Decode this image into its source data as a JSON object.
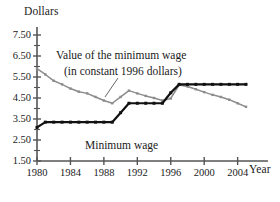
{
  "figure": {
    "background": "#ffffff",
    "axis_color": "#555555"
  },
  "labels": {
    "y_axis_title": "Dollars",
    "x_axis_title": "Year"
  },
  "annotations": {
    "real_line1": "Value of the minimum wage",
    "real_line2": "(in constant 1996 dollars)",
    "nominal": "Minimum wage"
  },
  "chart_data": {
    "type": "line",
    "title": "",
    "xlabel": "Year",
    "ylabel": "Dollars",
    "xlim": [
      1980,
      2005
    ],
    "ylim": [
      1.5,
      7.5
    ],
    "grid": false,
    "legend_position": "inline-annotations",
    "y_ticks": [
      "1.50",
      "2.50",
      "3.50",
      "4.50",
      "5.50",
      "6.50",
      "7.50"
    ],
    "y_tick_values": [
      1.5,
      2.5,
      3.5,
      4.5,
      5.5,
      6.5,
      7.5
    ],
    "y_minor_tick_values": [
      2.0,
      3.0,
      4.0,
      5.0,
      6.0,
      7.0
    ],
    "x_ticks": [
      "1980",
      "1984",
      "1988",
      "1992",
      "1996",
      "2000",
      "2004"
    ],
    "x_tick_values": [
      1980,
      1984,
      1988,
      1992,
      1996,
      2000,
      2004
    ],
    "x": [
      1980,
      1981,
      1982,
      1983,
      1984,
      1985,
      1986,
      1987,
      1988,
      1989,
      1990,
      1991,
      1992,
      1993,
      1994,
      1995,
      1996,
      1997,
      1998,
      1999,
      2000,
      2001,
      2002,
      2003,
      2004,
      2005
    ],
    "series": [
      {
        "name": "Value of the minimum wage (in constant 1996 dollars)",
        "color": "#8c8c8c",
        "marker": "square",
        "values": [
          5.9,
          5.62,
          5.32,
          5.15,
          4.95,
          4.8,
          4.72,
          4.55,
          4.38,
          4.25,
          4.55,
          4.85,
          4.72,
          4.6,
          4.5,
          4.38,
          4.48,
          5.12,
          5.05,
          4.92,
          4.78,
          4.65,
          4.55,
          4.42,
          4.25,
          4.08
        ]
      },
      {
        "name": "Minimum wage",
        "color": "#111111",
        "marker": "square",
        "values": [
          3.1,
          3.35,
          3.35,
          3.35,
          3.35,
          3.35,
          3.35,
          3.35,
          3.35,
          3.35,
          3.8,
          4.25,
          4.25,
          4.25,
          4.25,
          4.25,
          4.75,
          5.15,
          5.15,
          5.15,
          5.15,
          5.15,
          5.15,
          5.15,
          5.15,
          5.15
        ]
      }
    ]
  }
}
